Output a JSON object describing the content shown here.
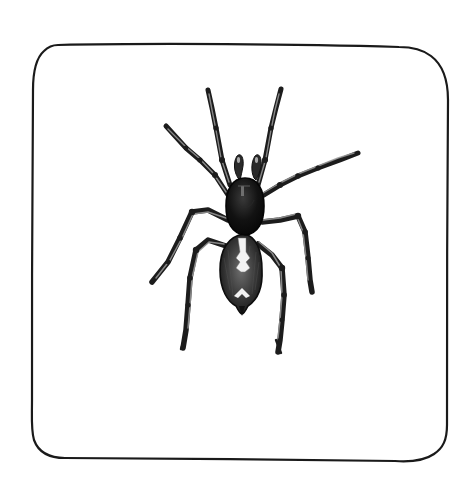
{
  "illustration": {
    "subject": "spider",
    "style": "engraving, black and white",
    "background_color": "#ffffff",
    "ink_color": "#1a1a1a",
    "frame": {
      "shape": "hand-drawn rounded rectangle",
      "x": 32,
      "y": 44,
      "width": 417,
      "height": 416,
      "corner_radius": 26
    },
    "parts": {
      "cephalothorax": "dark oval carapace",
      "abdomen": "oval with pale central chevron markings",
      "legs": 8,
      "pedipalps": 2
    }
  }
}
